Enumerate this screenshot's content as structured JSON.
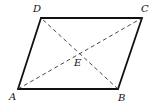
{
  "diagram": {
    "type": "parallelogram",
    "points": {
      "A": {
        "x": 18,
        "y": 89
      },
      "B": {
        "x": 118,
        "y": 89
      },
      "C": {
        "x": 142,
        "y": 18
      },
      "D": {
        "x": 41,
        "y": 18
      },
      "E": {
        "x": 80,
        "y": 53
      }
    },
    "labels": {
      "A": "A",
      "B": "B",
      "C": "C",
      "D": "D",
      "E": "E"
    },
    "sides": [
      "AB",
      "BC",
      "CD",
      "DA"
    ],
    "diagonals": [
      "AC",
      "BD"
    ],
    "intersection": "E",
    "colors": {
      "edge": "#111111",
      "diagonal": "#333333",
      "background": "#ffffff"
    }
  }
}
